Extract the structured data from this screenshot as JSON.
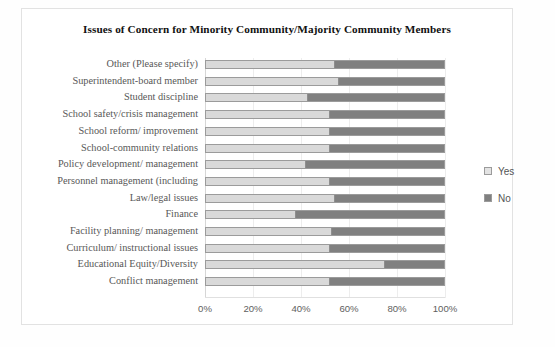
{
  "chart_data": {
    "type": "bar",
    "orientation": "horizontal",
    "stacked": true,
    "normalized_percent": true,
    "title": "Issues of Concern for Minority Community/Majority Community Members",
    "xlabel": "",
    "ylabel": "",
    "xlim": [
      0,
      100
    ],
    "xticks": [
      0,
      20,
      40,
      60,
      80,
      100
    ],
    "xtick_labels": [
      "0%",
      "20%",
      "40%",
      "60%",
      "80%",
      "100%"
    ],
    "grid": true,
    "legend_position": "right",
    "categories": [
      "Other (Please specify)",
      "Superintendent-board member",
      "Student discipline",
      "School safety/crisis management",
      "School reform/ improvement",
      "School-community relations",
      "Policy development/ management",
      "Personnel management (including",
      "Law/legal issues",
      "Finance",
      "Facility planning/ management",
      "Curriculum/ instructional issues",
      "Educational Equity/Diversity",
      "Conflict management"
    ],
    "series": [
      {
        "name": "Yes",
        "color": "#d9d9d9",
        "values": [
          54,
          56,
          43,
          52,
          52,
          52,
          42,
          52,
          54,
          38,
          53,
          52,
          75,
          52
        ]
      },
      {
        "name": "No",
        "color": "#808080",
        "values": [
          46,
          44,
          57,
          48,
          48,
          48,
          58,
          48,
          46,
          62,
          47,
          48,
          25,
          48
        ]
      }
    ]
  },
  "legend": {
    "items": [
      {
        "label": "Yes",
        "swatch": "yes"
      },
      {
        "label": "No",
        "swatch": "no"
      }
    ]
  }
}
